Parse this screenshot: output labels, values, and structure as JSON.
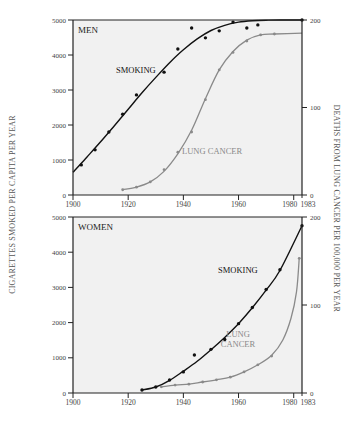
{
  "figure": {
    "left_axis_title": "CIGARETTES SMOKED PER CAPITA PER YEAR",
    "right_axis_title": "DEATHS FROM LUNG CANCER PER 100,000 PER YEAR"
  },
  "colors": {
    "plot_bg": "#f1f1f1",
    "smoking": "#111111",
    "lung_cancer": "#8a8a8a",
    "axis": "#222222",
    "tick_text": "#444444"
  },
  "chart_data": [
    {
      "type": "line",
      "title": "MEN",
      "xlabel": "",
      "ylabel": "CIGARETTES SMOKED PER CAPITA PER YEAR",
      "y2label": "DEATHS FROM LUNG CANCER PER 100,000 PER YEAR",
      "xlim": [
        1900,
        1983
      ],
      "ylim": [
        0,
        5000
      ],
      "y2lim": [
        0,
        200
      ],
      "x_ticks": [
        "1900",
        "1920",
        "1940",
        "1960",
        "1980",
        "1983"
      ],
      "y_ticks": [
        "0",
        "1000",
        "2000",
        "3000",
        "4000",
        "5000"
      ],
      "y2_ticks": [
        "0",
        "100",
        "200"
      ],
      "grid": false,
      "series": [
        {
          "name": "SMOKING",
          "axis": "left",
          "x": [
            1903,
            1908,
            1913,
            1918,
            1923,
            1933,
            1938,
            1943,
            1948,
            1953,
            1958,
            1963,
            1967,
            1983
          ],
          "values": [
            860,
            1290,
            1800,
            2310,
            2860,
            3510,
            4170,
            4770,
            4490,
            4690,
            4940,
            4770,
            4860,
            5000
          ],
          "fit_x": [
            1900,
            1905,
            1910,
            1915,
            1920,
            1925,
            1930,
            1935,
            1940,
            1945,
            1950,
            1955,
            1960,
            1965,
            1970,
            1975,
            1983
          ],
          "fit_values": [
            650,
            1080,
            1520,
            1980,
            2450,
            2920,
            3360,
            3780,
            4150,
            4460,
            4700,
            4850,
            4940,
            4980,
            4995,
            5000,
            5000
          ]
        },
        {
          "name": "LUNG CANCER",
          "axis": "right",
          "x": [
            1918,
            1923,
            1928,
            1933,
            1938,
            1943,
            1948,
            1953,
            1958,
            1963,
            1968,
            1973
          ],
          "values": [
            6,
            9,
            15,
            29,
            49,
            72,
            109,
            143,
            163,
            176,
            183,
            184
          ],
          "fit_x": [
            1918,
            1923,
            1928,
            1933,
            1938,
            1943,
            1948,
            1953,
            1958,
            1963,
            1968,
            1973,
            1983
          ],
          "fit_values": [
            6,
            9,
            15,
            27,
            47,
            74,
            110,
            143,
            164,
            177,
            183,
            184,
            185
          ]
        }
      ],
      "annotations": [
        "MEN",
        "SMOKING",
        "LUNG CANCER"
      ]
    },
    {
      "type": "line",
      "title": "WOMEN",
      "xlabel": "",
      "ylabel": "CIGARETTES SMOKED PER CAPITA PER YEAR",
      "y2label": "DEATHS FROM LUNG CANCER PER 100,000 PER YEAR",
      "xlim": [
        1900,
        1983
      ],
      "ylim": [
        0,
        5000
      ],
      "y2lim": [
        0,
        200
      ],
      "x_ticks": [
        "1900",
        "1920",
        "1940",
        "1960",
        "1980",
        "1983"
      ],
      "y_ticks": [
        "0",
        "1000",
        "2000",
        "3000",
        "4000",
        "5000"
      ],
      "y2_ticks": [
        "0",
        "100",
        "200"
      ],
      "grid": false,
      "series": [
        {
          "name": "SMOKING",
          "axis": "left",
          "x": [
            1925,
            1930,
            1935,
            1940,
            1944,
            1950,
            1955,
            1960,
            1965,
            1970,
            1975,
            1983
          ],
          "values": [
            85,
            170,
            370,
            600,
            1080,
            1240,
            1520,
            1970,
            2430,
            2940,
            3500,
            4750
          ],
          "fit_x": [
            1925,
            1930,
            1935,
            1940,
            1945,
            1950,
            1955,
            1960,
            1965,
            1970,
            1975,
            1983
          ],
          "fit_values": [
            85,
            170,
            360,
            620,
            900,
            1230,
            1580,
            1970,
            2420,
            2920,
            3480,
            4750
          ]
        },
        {
          "name": "LUNG CANCER",
          "axis": "right",
          "x": [
            1932,
            1937,
            1942,
            1947,
            1952,
            1957,
            1962,
            1967,
            1972,
            1982
          ],
          "values": [
            7,
            9,
            10,
            12.5,
            15,
            18,
            24,
            32,
            42,
            153
          ],
          "fit_x": [
            1932,
            1937,
            1942,
            1947,
            1952,
            1957,
            1962,
            1967,
            1972,
            1976,
            1979,
            1981,
            1982
          ],
          "fit_values": [
            7,
            9,
            10,
            12.5,
            15,
            18,
            24,
            32,
            43,
            60,
            85,
            115,
            153
          ]
        }
      ],
      "annotations": [
        "WOMEN",
        "SMOKING",
        "LUNG CANCER"
      ]
    }
  ],
  "panels": {
    "men": {
      "title": "MEN",
      "smoking_label": "SMOKING",
      "cancer_label": "LUNG CANCER"
    },
    "women": {
      "title": "WOMEN",
      "smoking_label": "SMOKING",
      "cancer_label_line1": "LUNG",
      "cancer_label_line2": "CANCER"
    }
  },
  "ticks": {
    "x": [
      "1900",
      "1920",
      "1940",
      "1960",
      "1980",
      "1983"
    ],
    "y": [
      "0",
      "1000",
      "2000",
      "3000",
      "4000",
      "5000"
    ],
    "y2": [
      "0",
      "100",
      "200"
    ]
  }
}
